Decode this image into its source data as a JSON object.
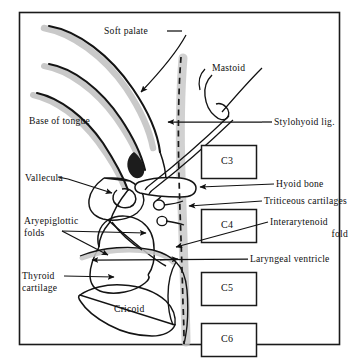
{
  "figure": {
    "border_color": "#1a1a1a",
    "background": "#ffffff",
    "ink_color": "#111111",
    "shadow_color": "#b9b9b9",
    "dash_color": "#1a1a1a"
  },
  "labels": {
    "soft_palate": "Soft palate",
    "mastoid": "Mastoid",
    "base_of_tongue": "Base of tongue",
    "stylohyoid_lig": "Stylohyoid lig.",
    "vallecula": "Vallecula",
    "hyoid_bone": "Hyoid bone",
    "triticeous_cartilages": "Triticeous cartilages",
    "aryepiglottic_folds_line1": "Aryepiglottic",
    "aryepiglottic_folds_line2": "folds",
    "interarytenoid_fold_line1": "Interarytenoid",
    "interarytenoid_fold_line2": "fold",
    "thyroid_cartilage_line1": "Thyroid",
    "thyroid_cartilage_line2": "cartilage",
    "laryngeal_ventricle": "Laryngeal ventricle",
    "cricoid": "Cricoid"
  },
  "vertebrae": [
    {
      "name": "C3",
      "label": "C3"
    },
    {
      "name": "C4",
      "label": "C4"
    },
    {
      "name": "C5",
      "label": "C5"
    },
    {
      "name": "C6",
      "label": "C6"
    }
  ]
}
